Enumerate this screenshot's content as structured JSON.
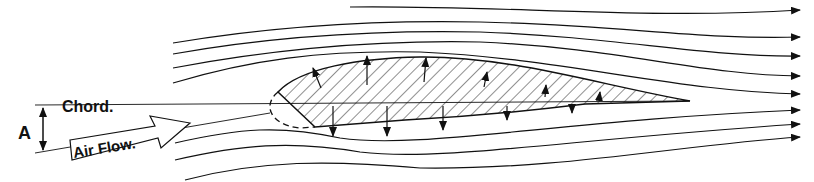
{
  "diagram": {
    "labels": {
      "chord": "Chord.",
      "air_flow": "Air Flow.",
      "angle": "A"
    },
    "colors": {
      "ink": "#111111",
      "background": "#ffffff"
    },
    "streamlines_above": 6,
    "streamlines_below": 4,
    "upper_arrows": 6,
    "lower_arrows": 6
  }
}
